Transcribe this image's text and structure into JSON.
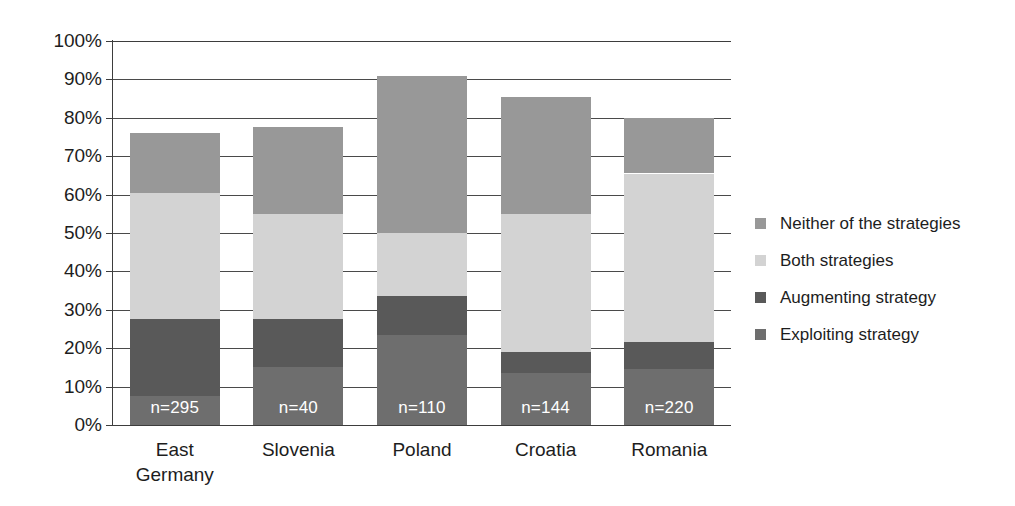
{
  "chart_data": {
    "type": "bar",
    "subtype": "stacked-bar",
    "title": "",
    "xlabel": "",
    "ylabel": "",
    "ylim": [
      0,
      100
    ],
    "y_unit": "%",
    "grid": true,
    "legend_position": "right",
    "categories": [
      "East Germany",
      "Slovenia",
      "Poland",
      "Croatia",
      "Romania"
    ],
    "category_lines": [
      [
        "East",
        "Germany"
      ],
      [
        "Slovenia"
      ],
      [
        "Poland"
      ],
      [
        "Croatia"
      ],
      [
        "Romania"
      ]
    ],
    "sample_sizes": [
      "n=295",
      "n=40",
      "n=110",
      "n=144",
      "n=220"
    ],
    "y_ticks": [
      "0%",
      "10%",
      "20%",
      "30%",
      "40%",
      "50%",
      "60%",
      "70%",
      "80%",
      "90%",
      "100%"
    ],
    "y_tick_values": [
      0,
      10,
      20,
      30,
      40,
      50,
      60,
      70,
      80,
      90,
      100
    ],
    "stack_order_bottom_to_top": [
      "Exploiting strategy",
      "Augmenting strategy",
      "Both strategies",
      "Neither of the strategies"
    ],
    "series": [
      {
        "name": "Exploiting strategy",
        "color": "#6e6e6e",
        "values": [
          7.5,
          15.0,
          23.5,
          13.5,
          14.5
        ]
      },
      {
        "name": "Augmenting strategy",
        "color": "#595959",
        "values": [
          20.0,
          12.5,
          10.0,
          5.5,
          7.0
        ]
      },
      {
        "name": "Both strategies",
        "color": "#d3d3d3",
        "values": [
          33.0,
          27.5,
          16.5,
          36.0,
          44.0
        ]
      },
      {
        "name": "Neither of the strategies",
        "color": "#989898",
        "values": [
          15.5,
          22.5,
          41.0,
          30.5,
          14.5
        ]
      }
    ],
    "bar_totals": [
      76.0,
      77.5,
      91.0,
      85.5,
      80.0
    ],
    "cumulative_tops": {
      "East Germany": [
        7.5,
        27.5,
        60.5,
        76.0
      ],
      "Slovenia": [
        15.0,
        27.5,
        55.0,
        77.5
      ],
      "Poland": [
        23.5,
        33.5,
        50.0,
        91.0
      ],
      "Croatia": [
        13.5,
        19.0,
        55.0,
        85.5
      ],
      "Romania": [
        14.5,
        21.5,
        65.5,
        80.0
      ]
    }
  },
  "legend": {
    "items": [
      {
        "label": "Neither of the strategies",
        "color": "#989898"
      },
      {
        "label": "Both strategies",
        "color": "#d3d3d3"
      },
      {
        "label": "Augmenting strategy",
        "color": "#595959"
      },
      {
        "label": "Exploiting strategy",
        "color": "#6e6e6e"
      }
    ]
  },
  "colors": {
    "axis": "#3d3d3d",
    "gridline": "#4a4a4a",
    "background": "#ffffff",
    "text": "#1d1d1d",
    "n_label_text": "#ffffff"
  }
}
